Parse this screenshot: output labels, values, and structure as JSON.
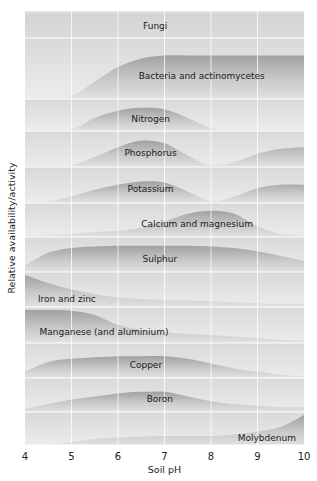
{
  "chart_data": {
    "type": "area",
    "title": "",
    "xlabel": "Soil pH",
    "ylabel": "Relative availability/activity",
    "xlim": [
      4,
      10
    ],
    "x_ticks": [
      4,
      5,
      6,
      7,
      8,
      9,
      10
    ],
    "x": [
      4,
      4.5,
      5,
      5.5,
      6,
      6.5,
      7,
      7.5,
      8,
      8.5,
      9,
      9.5,
      10
    ],
    "grid": true,
    "legend": "none (labels drawn inside bands)",
    "series": [
      {
        "name": "Fungi",
        "label_x": 6.8,
        "values": [
          1,
          1,
          1,
          1,
          1,
          1,
          1,
          1,
          1,
          1,
          1,
          1,
          1
        ]
      },
      {
        "name": "Bacteria and actinomycetes",
        "label_x": 7.8,
        "values": [
          0,
          0,
          0.05,
          0.3,
          0.55,
          0.7,
          0.75,
          0.75,
          0.75,
          0.75,
          0.75,
          0.75,
          0.75
        ]
      },
      {
        "name": "Nitrogen",
        "label_x": 6.7,
        "values": [
          0,
          0,
          0.05,
          0.45,
          0.7,
          0.8,
          0.75,
          0.45,
          0.1,
          0,
          0,
          0,
          0
        ]
      },
      {
        "name": "Phosphorus",
        "label_x": 6.7,
        "values": [
          0,
          0,
          0.05,
          0.3,
          0.6,
          0.8,
          0.72,
          0.35,
          0.05,
          0.15,
          0.4,
          0.55,
          0.6
        ]
      },
      {
        "name": "Potassium",
        "label_x": 6.7,
        "values": [
          0,
          0.05,
          0.2,
          0.4,
          0.55,
          0.65,
          0.62,
          0.35,
          0.05,
          0.2,
          0.45,
          0.55,
          0.55
        ]
      },
      {
        "name": "Calcium and magnesium",
        "label_x": 7.7,
        "values": [
          0,
          0.05,
          0.1,
          0.15,
          0.2,
          0.3,
          0.5,
          0.75,
          0.85,
          0.75,
          0.35,
          0.1,
          0.05
        ]
      },
      {
        "name": "Sulphur",
        "label_x": 6.9,
        "values": [
          0.2,
          0.6,
          0.75,
          0.8,
          0.82,
          0.82,
          0.82,
          0.82,
          0.8,
          0.75,
          0.65,
          0.5,
          0.35
        ]
      },
      {
        "name": "Iron and zinc",
        "label_x": 4.9,
        "values": [
          1,
          0.75,
          0.55,
          0.4,
          0.3,
          0.25,
          0.22,
          0.2,
          0.18,
          0.15,
          0.12,
          0.1,
          0.1
        ]
      },
      {
        "name": "Manganese (and aluminium)",
        "label_x": 5.7,
        "values": [
          1,
          1,
          0.98,
          0.85,
          0.55,
          0.4,
          0.32,
          0.28,
          0.24,
          0.2,
          0.15,
          0.1,
          0.08
        ]
      },
      {
        "name": "Copper",
        "label_x": 6.6,
        "values": [
          0.2,
          0.5,
          0.6,
          0.65,
          0.68,
          0.68,
          0.68,
          0.6,
          0.45,
          0.3,
          0.2,
          0.1,
          0.05
        ]
      },
      {
        "name": "Boron",
        "label_x": 6.9,
        "values": [
          0.1,
          0.25,
          0.4,
          0.5,
          0.6,
          0.65,
          0.65,
          0.5,
          0.35,
          0.25,
          0.2,
          0.15,
          0.15
        ]
      },
      {
        "name": "Molybdenum",
        "label_x": 9.2,
        "values": [
          0,
          0,
          0.1,
          0.2,
          0.25,
          0.28,
          0.3,
          0.3,
          0.3,
          0.35,
          0.45,
          0.6,
          1
        ]
      }
    ]
  },
  "axes": {
    "xlabel": "Soil pH",
    "ylabel": "Relative availability/activity",
    "ticks": [
      "4",
      "5",
      "6",
      "7",
      "8",
      "9",
      "10"
    ]
  },
  "bands": [
    {
      "label": "Fungi"
    },
    {
      "label": "Bacteria and actinomycetes"
    },
    {
      "label": "Nitrogen"
    },
    {
      "label": "Phosphorus"
    },
    {
      "label": "Potassium"
    },
    {
      "label": "Calcium and magnesium"
    },
    {
      "label": "Sulphur"
    },
    {
      "label": "Iron and zinc"
    },
    {
      "label": "Manganese (and aluminium)"
    },
    {
      "label": "Copper"
    },
    {
      "label": "Boron"
    },
    {
      "label": "Molybdenum"
    }
  ],
  "colors": {
    "band_background": "#e6e6e6",
    "band_fill_dark": "#9a9a9a",
    "band_fill_light": "#dcdcdc",
    "grid": "#ffffff",
    "text": "#1a1a1a"
  }
}
